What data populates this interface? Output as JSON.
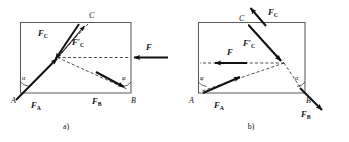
{
  "figure": {
    "type": "physics-force-diagram",
    "panels": [
      {
        "id": "a",
        "caption": "a)",
        "vertices": [
          {
            "name": "A",
            "label": "A"
          },
          {
            "name": "B",
            "label": "B"
          },
          {
            "name": "C",
            "label": "C"
          }
        ],
        "angles": [
          {
            "name": "alpha-at-A",
            "label": "α"
          },
          {
            "name": "phi-at-B",
            "label": "φ"
          }
        ],
        "forces": [
          {
            "name": "F",
            "label": "F",
            "sub": "",
            "prime": false,
            "direction": "left"
          },
          {
            "name": "FA",
            "label": "F",
            "sub": "A",
            "prime": false,
            "direction": "up-right"
          },
          {
            "name": "FB",
            "label": "F",
            "sub": "B",
            "prime": false,
            "direction": "down-right"
          },
          {
            "name": "FC",
            "label": "F",
            "sub": "C",
            "prime": false,
            "direction": "down-left"
          },
          {
            "name": "FCprime",
            "label": "F",
            "sub": "C",
            "prime": true,
            "direction": "up-right"
          }
        ]
      },
      {
        "id": "b",
        "caption": "b)",
        "vertices": [
          {
            "name": "A",
            "label": "A"
          },
          {
            "name": "B",
            "label": "B"
          },
          {
            "name": "C",
            "label": "C"
          }
        ],
        "angles": [
          {
            "name": "phi-at-A",
            "label": "φ"
          },
          {
            "name": "alpha-at-B",
            "label": "α"
          }
        ],
        "forces": [
          {
            "name": "F",
            "label": "F",
            "sub": "",
            "prime": false,
            "direction": "left"
          },
          {
            "name": "FA",
            "label": "F",
            "sub": "A",
            "prime": false,
            "direction": "up-right"
          },
          {
            "name": "FB",
            "label": "F",
            "sub": "B",
            "prime": false,
            "direction": "down-right"
          },
          {
            "name": "FC",
            "label": "F",
            "sub": "C",
            "prime": false,
            "direction": "up-right"
          },
          {
            "name": "FCprime",
            "label": "F",
            "sub": "C",
            "prime": true,
            "direction": "down-right"
          }
        ]
      }
    ],
    "colors": {
      "frame": "#5b5b5b",
      "vector": "#111111",
      "dashed": "#2b2b2b",
      "background": "#ffffff"
    }
  }
}
